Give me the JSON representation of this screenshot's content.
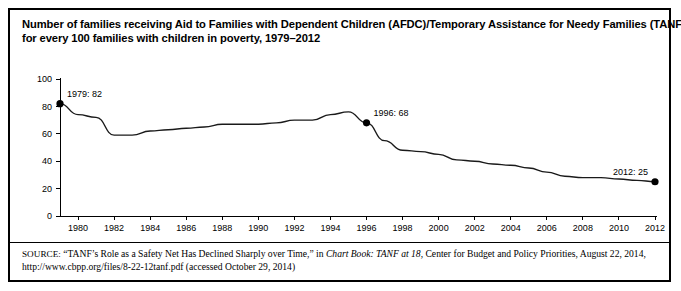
{
  "figure": {
    "title_lines": [
      "Number of families receiving Aid to Families with Dependent Children (AFDC)/Temporary Assistance for Needy Families (TANF) benefits",
      "for every 100 families with children in poverty, 1979–2012"
    ],
    "source": {
      "label": "SOURCE:",
      "text_before_italic": " “TANF’s Role as a Safety Net Has Declined Sharply over Time,” in ",
      "italic_title": "Chart Book: TANF at 18",
      "text_after_italic": ", Center for Budget and Policy Priorities, August 22, 2014, http://www.cbpp.org/files/8-22-12tanf.pdf (accessed October 29, 2014)"
    }
  },
  "chart_data": {
    "type": "line",
    "title": "Number of families receiving Aid to Families with Dependent Children (AFDC)/Temporary Assistance for Needy Families (TANF) benefits for every 100 families with children in poverty, 1979–2012",
    "xlabel": "",
    "ylabel": "",
    "xlim": [
      1979,
      2012
    ],
    "ylim": [
      0,
      100
    ],
    "grid": false,
    "legend": "none",
    "line_color": "#1a1a1a",
    "x": [
      1979,
      1980,
      1981,
      1982,
      1983,
      1984,
      1985,
      1986,
      1987,
      1988,
      1989,
      1990,
      1991,
      1992,
      1993,
      1994,
      1995,
      1996,
      1997,
      1998,
      1999,
      2000,
      2001,
      2002,
      2003,
      2004,
      2005,
      2006,
      2007,
      2008,
      2009,
      2010,
      2011,
      2012
    ],
    "values": [
      82,
      74,
      72,
      59,
      59,
      62,
      63,
      64,
      65,
      67,
      67,
      67,
      68,
      70,
      70,
      74,
      76,
      68,
      55,
      48,
      47,
      45,
      41,
      40,
      38,
      37,
      35,
      32,
      29,
      28,
      28,
      27,
      26,
      25
    ],
    "ytick_values": [
      0,
      20,
      40,
      60,
      80,
      100
    ],
    "ytick_labels": [
      "0",
      "20",
      "40",
      "60",
      "80",
      "100"
    ],
    "xtick_values": [
      1980,
      1982,
      1984,
      1986,
      1988,
      1990,
      1992,
      1994,
      1996,
      1998,
      2000,
      2002,
      2004,
      2006,
      2008,
      2010,
      2012
    ],
    "xtick_labels": [
      "1980",
      "1982",
      "1984",
      "1986",
      "1988",
      "1990",
      "1992",
      "1994",
      "1996",
      "1998",
      "2000",
      "2002",
      "2004",
      "2006",
      "2008",
      "2010",
      "2012"
    ],
    "annotations": [
      {
        "label": "1979: 82",
        "x": 1979,
        "y": 82,
        "marker": true
      },
      {
        "label": "1996: 68",
        "x": 1996,
        "y": 68,
        "marker": true
      },
      {
        "label": "2012: 25",
        "x": 2012,
        "y": 25,
        "marker": true
      }
    ]
  }
}
